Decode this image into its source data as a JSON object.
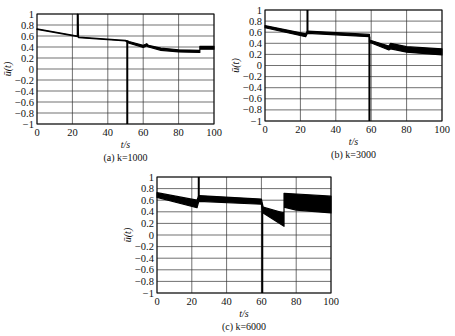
{
  "figure": {
    "panels": [
      {
        "id": "a",
        "caption": "(a)  k=1000",
        "xlabel": "t/s",
        "ylabel": "ū(t)"
      },
      {
        "id": "b",
        "caption": "(b)  k=3000",
        "xlabel": "t/s",
        "ylabel": "ū(t)"
      },
      {
        "id": "c",
        "caption": "(c)  k=6000",
        "xlabel": "t/s",
        "ylabel": "ū(t)"
      }
    ]
  },
  "chart_data": [
    {
      "type": "line",
      "title": "(a) k=1000",
      "xlabel": "t/s",
      "ylabel": "ū(t)",
      "xlim": [
        0,
        100
      ],
      "ylim": [
        -1,
        1
      ],
      "xticks": [
        0,
        20,
        40,
        60,
        80,
        100
      ],
      "yticks": [
        1,
        0.8,
        0.6,
        0.4,
        0.2,
        0,
        -0.2,
        -0.4,
        -0.6,
        -0.8,
        -1
      ],
      "grid": true,
      "series": [
        {
          "name": "upper",
          "x": [
            0,
            23,
            23,
            23.5,
            50,
            52,
            60,
            62,
            63,
            70,
            80,
            92,
            92,
            100
          ],
          "y": [
            0.73,
            0.6,
            1.0,
            0.58,
            0.52,
            0.5,
            0.43,
            0.46,
            0.43,
            0.38,
            0.35,
            0.34,
            0.41,
            0.41
          ]
        },
        {
          "name": "lower",
          "x": [
            0,
            23,
            23.5,
            50,
            52,
            60,
            62,
            63,
            70,
            80,
            92,
            92,
            100
          ],
          "y": [
            0.72,
            0.59,
            0.57,
            0.51,
            0.47,
            0.39,
            0.42,
            0.4,
            0.34,
            0.31,
            0.3,
            0.36,
            0.36
          ]
        }
      ],
      "spikes": [
        {
          "x": 23,
          "y_from": 0.6,
          "y_to": 1.0
        },
        {
          "x": 51,
          "y_from": 0.52,
          "y_to": -1.0
        }
      ]
    },
    {
      "type": "line",
      "title": "(b) k=3000",
      "xlabel": "t/s",
      "ylabel": "ū(t)",
      "xlim": [
        0,
        100
      ],
      "ylim": [
        -1,
        1
      ],
      "xticks": [
        0,
        20,
        40,
        60,
        80,
        100
      ],
      "yticks": [
        1,
        0.8,
        0.6,
        0.4,
        0.2,
        0,
        -0.2,
        -0.4,
        -0.6,
        -0.8,
        -1
      ],
      "grid": true,
      "series": [
        {
          "name": "upper",
          "x": [
            0,
            23,
            24,
            59,
            59,
            70,
            71,
            80,
            100
          ],
          "y": [
            0.72,
            0.57,
            0.62,
            0.56,
            0.46,
            0.35,
            0.4,
            0.34,
            0.3
          ]
        },
        {
          "name": "lower",
          "x": [
            0,
            23,
            24,
            59,
            59,
            70,
            71,
            80,
            100
          ],
          "y": [
            0.68,
            0.52,
            0.58,
            0.52,
            0.42,
            0.28,
            0.3,
            0.24,
            0.19
          ]
        }
      ],
      "spikes": [
        {
          "x": 24,
          "y_from": 0.6,
          "y_to": 1.0
        },
        {
          "x": 59,
          "y_from": 0.52,
          "y_to": -1.0
        }
      ]
    },
    {
      "type": "line",
      "title": "(c) k=6000",
      "xlabel": "t/s",
      "ylabel": "ū(t)",
      "xlim": [
        0,
        100
      ],
      "ylim": [
        -1,
        1
      ],
      "xticks": [
        0,
        20,
        40,
        60,
        80,
        100
      ],
      "yticks": [
        1,
        0.8,
        0.6,
        0.4,
        0.2,
        0,
        -0.2,
        -0.4,
        -0.6,
        -0.8,
        -1
      ],
      "grid": true,
      "series": [
        {
          "name": "upper",
          "x": [
            0,
            23,
            24,
            60,
            61,
            73,
            73,
            100
          ],
          "y": [
            0.73,
            0.6,
            0.68,
            0.62,
            0.48,
            0.38,
            0.72,
            0.67
          ]
        },
        {
          "name": "lower",
          "x": [
            0,
            23,
            24,
            60,
            61,
            73,
            73,
            80,
            100
          ],
          "y": [
            0.65,
            0.47,
            0.58,
            0.53,
            0.38,
            0.15,
            0.48,
            0.43,
            0.38
          ]
        }
      ],
      "spikes": [
        {
          "x": 24,
          "y_from": 0.65,
          "y_to": 1.0
        },
        {
          "x": 60.5,
          "y_from": 0.5,
          "y_to": -1.0
        }
      ]
    }
  ]
}
